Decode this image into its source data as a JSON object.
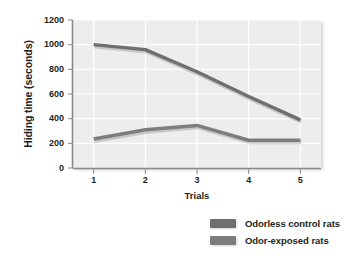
{
  "chart_data": {
    "type": "line",
    "title": "",
    "xlabel": "Trials",
    "ylabel": "Hiding time (seconds)",
    "x": [
      1,
      2,
      3,
      4,
      5
    ],
    "categories": [
      "1",
      "2",
      "3",
      "4",
      "5"
    ],
    "xlim": [
      0.6,
      5.4
    ],
    "ylim": [
      0,
      1200
    ],
    "yticks": [
      0,
      200,
      400,
      600,
      800,
      1000,
      1200
    ],
    "ytick_labels": [
      "0",
      "200",
      "400",
      "600",
      "800",
      "1000",
      "1200"
    ],
    "xtick_labels": [
      "1",
      "2",
      "3",
      "4",
      "5"
    ],
    "grid": true,
    "grid_color": "#ffffff",
    "plot_background": "#ededed",
    "legend_position": "bottom-right",
    "series": [
      {
        "name": "Odorless control rats",
        "values": [
          1000,
          960,
          780,
          580,
          390
        ],
        "color": "#6f6f6f"
      },
      {
        "name": "Odor-exposed rats",
        "values": [
          235,
          310,
          345,
          225,
          225
        ],
        "color": "#7d7d7d"
      }
    ]
  },
  "axes": {
    "y_title": "Hiding time (seconds)",
    "x_title": "Trials",
    "y_ticks": [
      "1200",
      "1000",
      "800",
      "600",
      "400",
      "200",
      "0"
    ],
    "x_ticks": [
      "1",
      "2",
      "3",
      "4",
      "5"
    ]
  },
  "legend": {
    "items": [
      {
        "label": "Odorless control rats",
        "color": "#6f6f6f"
      },
      {
        "label": "Odor-exposed rats",
        "color": "#7d7d7d"
      }
    ]
  },
  "colors": {
    "plot_bg": "#ededed",
    "grid": "#ffffff",
    "axis": "#8a8a8a",
    "text": "#231f20",
    "series_1": "#6f6f6f",
    "series_2": "#7d7d7d"
  }
}
